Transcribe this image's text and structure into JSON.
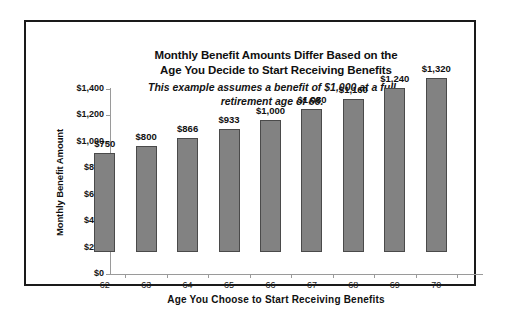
{
  "chart_data": {
    "type": "bar",
    "title": "Monthly Benefit Amounts Differ Based on the Age You Decide to Start Receiving Benefits",
    "title_line1": "Monthly Benefit Amounts Differ Based on the",
    "title_line2": "Age You Decide to Start Receiving Benefits",
    "subtitle": "This example assumes a benefit of $1,000 at a full retirement age of 66.",
    "subtitle_line1": "This example assumes a benefit of $1,000 at a full",
    "subtitle_line2": "retirement age of 66.",
    "xlabel": "Age You Choose to Start Receiving Benefits",
    "ylabel": "Monthly Benefit Amount",
    "categories": [
      "62",
      "63",
      "64",
      "65",
      "66",
      "67",
      "68",
      "69",
      "70"
    ],
    "values": [
      750,
      800,
      866,
      933,
      1000,
      1080,
      1160,
      1240,
      1320
    ],
    "value_labels": [
      "$750",
      "$800",
      "$866",
      "$933",
      "$1,000",
      "$1,080",
      "$1,160",
      "$1,240",
      "$1,320"
    ],
    "ylim": [
      0,
      1400
    ],
    "ytick_values": [
      0,
      200,
      400,
      600,
      800,
      1000,
      1200,
      1400
    ],
    "ytick_labels": [
      "$0",
      "$200",
      "$400",
      "$600",
      "$800",
      "$1,000",
      "$1,200",
      "$1,400"
    ],
    "grid": false,
    "legend": "none",
    "bar_color": "#828282",
    "bar_border_color": "#4a4a4a",
    "axis_color": "#9a9a9a",
    "text_color": "#101010",
    "background_color": "#ffffff",
    "frame_color": "#1a1a1a"
  }
}
